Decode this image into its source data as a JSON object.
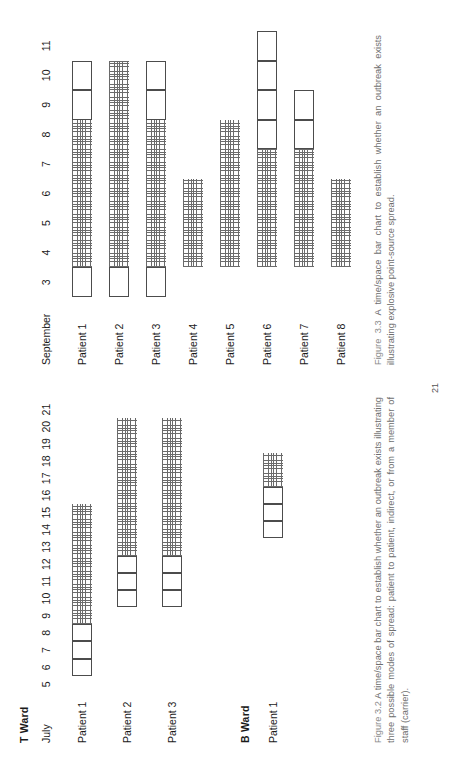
{
  "page": {
    "folio": "21"
  },
  "figure_32": {
    "month_label": "July",
    "ward_titles": {
      "t": "T Ward",
      "b": "B Ward"
    },
    "ticks": [
      "5",
      "6",
      "7",
      "8",
      "9",
      "10",
      "11",
      "12",
      "13",
      "14",
      "15",
      "16",
      "17",
      "18",
      "19",
      "20",
      "21"
    ],
    "t_ward_rows": [
      "Patient 1",
      "Patient 2",
      "Patient 3"
    ],
    "b_ward_rows": [
      "Patient 1"
    ],
    "caption": "Figure 3.2 A time/space bar chart to establish whether an outbreak exists illustrating three possible modes of spread: patient to patient, indirect, or from a member of staff (carrier).",
    "caption_figno": "Figure 3.2",
    "caption_rest": " A time/space bar chart to establish whether an outbreak exists illustrating three possible modes of spread: patient to patient, indirect, or from a member of staff (carrier)."
  },
  "figure_33": {
    "month_label": "September",
    "ticks": [
      "3",
      "4",
      "5",
      "6",
      "7",
      "8",
      "9",
      "10",
      "11"
    ],
    "rows": [
      "Patient 1",
      "Patient 2",
      "Patient 3",
      "Patient 4",
      "Patient 5",
      "Patient 6",
      "Patient 7",
      "Patient 8"
    ],
    "caption_figno": "Figure 3.3",
    "caption_rest": " A time/space bar chart to establish whether an outbreak exists illustrating explosive point-source spread."
  },
  "chart_data": [
    {
      "type": "bar",
      "title": "Figure 3.2 - T Ward / B Ward time/space bar chart",
      "xlabel": "July",
      "ylabel": "",
      "x": [
        5,
        6,
        7,
        8,
        9,
        10,
        11,
        12,
        13,
        14,
        15,
        16,
        17,
        18,
        19,
        20,
        21
      ],
      "xlim": [
        5,
        21
      ],
      "grid": false,
      "legend": [
        "open box = occupancy without infection",
        "hatched = infected / positive period"
      ],
      "groups": [
        {
          "group": "T Ward",
          "bars": [
            {
              "name": "Patient 1",
              "segments": [
                {
                  "style": "open",
                  "start": 6,
                  "end": 7
                },
                {
                  "style": "open",
                  "start": 7,
                  "end": 8
                },
                {
                  "style": "open",
                  "start": 8,
                  "end": 9
                },
                {
                  "style": "hatch",
                  "start": 9,
                  "end": 16
                }
              ]
            },
            {
              "name": "Patient 2",
              "segments": [
                {
                  "style": "open",
                  "start": 10,
                  "end": 11
                },
                {
                  "style": "open",
                  "start": 11,
                  "end": 12
                },
                {
                  "style": "open",
                  "start": 12,
                  "end": 13
                },
                {
                  "style": "hatch",
                  "start": 13,
                  "end": 21
                }
              ]
            },
            {
              "name": "Patient 3",
              "segments": [
                {
                  "style": "open",
                  "start": 10,
                  "end": 11
                },
                {
                  "style": "open",
                  "start": 11,
                  "end": 12
                },
                {
                  "style": "open",
                  "start": 12,
                  "end": 13
                },
                {
                  "style": "hatch",
                  "start": 13,
                  "end": 21
                }
              ]
            }
          ]
        },
        {
          "group": "B Ward",
          "bars": [
            {
              "name": "Patient 1",
              "segments": [
                {
                  "style": "open",
                  "start": 14,
                  "end": 15
                },
                {
                  "style": "open",
                  "start": 15,
                  "end": 16
                },
                {
                  "style": "open",
                  "start": 16,
                  "end": 17
                },
                {
                  "style": "hatch",
                  "start": 17,
                  "end": 19
                }
              ]
            }
          ]
        }
      ]
    },
    {
      "type": "bar",
      "title": "Figure 3.3 - explosive point-source outbreak time/space bar chart",
      "xlabel": "September",
      "ylabel": "",
      "x": [
        3,
        4,
        5,
        6,
        7,
        8,
        9,
        10,
        11
      ],
      "xlim": [
        3,
        11
      ],
      "grid": false,
      "legend": [
        "open box = occupancy without infection",
        "hatched = infected / positive period"
      ],
      "groups": [
        {
          "group": "",
          "bars": [
            {
              "name": "Patient 1",
              "segments": [
                {
                  "style": "open",
                  "start": 3,
                  "end": 4
                },
                {
                  "style": "hatch",
                  "start": 4,
                  "end": 9
                },
                {
                  "style": "open",
                  "start": 9,
                  "end": 10
                },
                {
                  "style": "open",
                  "start": 10,
                  "end": 11
                }
              ]
            },
            {
              "name": "Patient 2",
              "segments": [
                {
                  "style": "open",
                  "start": 3,
                  "end": 4
                },
                {
                  "style": "hatch",
                  "start": 4,
                  "end": 11
                }
              ]
            },
            {
              "name": "Patient 3",
              "segments": [
                {
                  "style": "open",
                  "start": 3,
                  "end": 4
                },
                {
                  "style": "hatch",
                  "start": 4,
                  "end": 9
                },
                {
                  "style": "open",
                  "start": 9,
                  "end": 10
                },
                {
                  "style": "open",
                  "start": 10,
                  "end": 11
                }
              ]
            },
            {
              "name": "Patient 4",
              "segments": [
                {
                  "style": "hatch",
                  "start": 4,
                  "end": 7
                }
              ]
            },
            {
              "name": "Patient 5",
              "segments": [
                {
                  "style": "hatch",
                  "start": 4,
                  "end": 9
                }
              ]
            },
            {
              "name": "Patient 6",
              "segments": [
                {
                  "style": "hatch",
                  "start": 4,
                  "end": 8
                },
                {
                  "style": "open",
                  "start": 8,
                  "end": 9
                },
                {
                  "style": "open",
                  "start": 9,
                  "end": 10
                },
                {
                  "style": "open",
                  "start": 10,
                  "end": 11
                },
                {
                  "style": "open",
                  "start": 11,
                  "end": 12
                }
              ]
            },
            {
              "name": "Patient 7",
              "segments": [
                {
                  "style": "hatch",
                  "start": 4,
                  "end": 8
                },
                {
                  "style": "open",
                  "start": 8,
                  "end": 9
                },
                {
                  "style": "open",
                  "start": 9,
                  "end": 10
                }
              ]
            },
            {
              "name": "Patient 8",
              "segments": [
                {
                  "style": "hatch",
                  "start": 4,
                  "end": 7
                }
              ]
            }
          ]
        }
      ]
    }
  ]
}
